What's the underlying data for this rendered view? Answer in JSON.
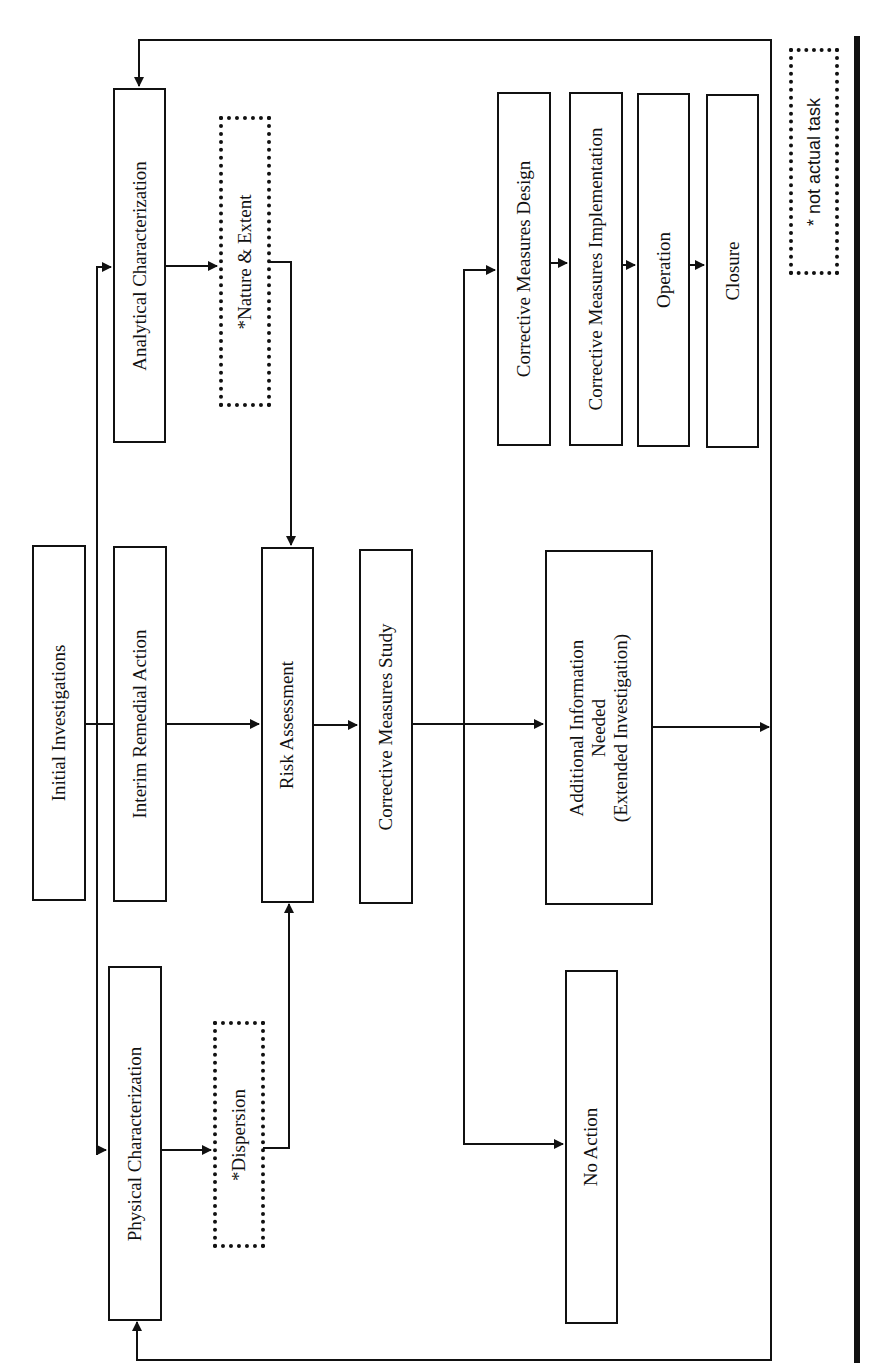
{
  "diagram": {
    "orientation": "rotated-90-ccw",
    "nodes": {
      "initial_investigations": {
        "label": "Initial Investigations"
      },
      "analytical_characterization": {
        "label": "Analytical Characterization"
      },
      "interim_remedial_action": {
        "label": "Interim Remedial Action"
      },
      "physical_characterization": {
        "label": "Physical Characterization"
      },
      "nature_extent": {
        "label": "*Nature & Extent",
        "style": "dotted"
      },
      "dispersion": {
        "label": "*Dispersion",
        "style": "dotted"
      },
      "risk_assessment": {
        "label": "Risk Assessment"
      },
      "corrective_measures_study": {
        "label": "Corrective Measures Study"
      },
      "corrective_measures_design": {
        "label": "Corrective Measures Design"
      },
      "corrective_measures_implementation": {
        "label": "Corrective Measures Implementation"
      },
      "operation": {
        "label": "Operation"
      },
      "closure": {
        "label": "Closure"
      },
      "additional_information": {
        "line1": "Additional Information",
        "line2": "Needed",
        "line3": "(Extended Investigation)"
      },
      "no_action": {
        "label": "No Action"
      }
    },
    "legend": {
      "label": "* not actual task",
      "style": "dotted"
    },
    "edges": [
      [
        "Initial Investigations",
        "Analytical Characterization"
      ],
      [
        "Initial Investigations",
        "Interim Remedial Action"
      ],
      [
        "Initial Investigations",
        "Physical Characterization"
      ],
      [
        "Analytical Characterization",
        "*Nature & Extent"
      ],
      [
        "Physical Characterization",
        "*Dispersion"
      ],
      [
        "*Nature & Extent",
        "Risk Assessment"
      ],
      [
        "*Dispersion",
        "Risk Assessment"
      ],
      [
        "Interim Remedial Action",
        "Risk Assessment"
      ],
      [
        "Risk Assessment",
        "Corrective Measures Study"
      ],
      [
        "Corrective Measures Study",
        "Corrective Measures Design"
      ],
      [
        "Corrective Measures Study",
        "Additional Information Needed (Extended Investigation)"
      ],
      [
        "Corrective Measures Study",
        "No Action"
      ],
      [
        "Corrective Measures Design",
        "Corrective Measures Implementation"
      ],
      [
        "Corrective Measures Implementation",
        "Operation"
      ],
      [
        "Operation",
        "Closure"
      ],
      [
        "Additional Information Needed (Extended Investigation)",
        "Analytical Characterization"
      ],
      [
        "Additional Information Needed (Extended Investigation)",
        "Physical Characterization"
      ]
    ],
    "colors": {
      "line": "#111111",
      "background": "#ffffff"
    }
  }
}
